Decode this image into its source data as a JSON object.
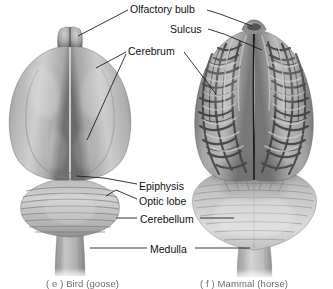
{
  "figure": {
    "title_alt": "Comparative dorsal views of vertebrate brains",
    "background": "#ffffff",
    "label_color": "#101010",
    "caption_color": "#4a4a4a",
    "labels": [
      {
        "id": "olfactory-bulb",
        "text": "Olfactory bulb"
      },
      {
        "id": "sulcus",
        "text": "Sulcus"
      },
      {
        "id": "cerebrum",
        "text": "Cerebrum"
      },
      {
        "id": "epiphysis",
        "text": "Epiphysis"
      },
      {
        "id": "optic-lobe",
        "text": "Optic lobe"
      },
      {
        "id": "cerebellum",
        "text": "Cerebellum"
      },
      {
        "id": "medulla",
        "text": "Medulla"
      }
    ],
    "captions": [
      {
        "id": "bird",
        "text": "( e )  Bird (goose)"
      },
      {
        "id": "mammal",
        "text": "( f )  Mammal (horse)"
      }
    ],
    "specimens": [
      {
        "id": "bird",
        "common_name": "goose",
        "group": "Bird",
        "view": "dorsal",
        "features": [
          "olfactory bulb",
          "cerebrum",
          "epiphysis",
          "optic lobe",
          "cerebellum",
          "medulla"
        ]
      },
      {
        "id": "mammal",
        "common_name": "horse",
        "group": "Mammal",
        "view": "dorsal",
        "features": [
          "olfactory bulb",
          "sulcus",
          "cerebrum",
          "cerebellum",
          "medulla"
        ]
      }
    ],
    "palette": {
      "tissue_light": "#d8d8d8",
      "tissue_mid": "#a8a8a8",
      "tissue_dark": "#6e6e6e",
      "sulcus_dark": "#3c3c3c",
      "gyrus_light": "#cfcfcf",
      "outline": "#555555",
      "leader_line": "#1a1a1a"
    }
  }
}
